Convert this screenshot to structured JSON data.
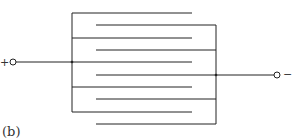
{
  "diagram": {
    "type": "interleaved-plate-capacitor",
    "caption": "(b)",
    "terminals": {
      "positive": {
        "label": "+",
        "x": 10,
        "y": 62
      },
      "negative": {
        "label": "−",
        "x": 278,
        "y": 75
      }
    },
    "left_bus_x": 72,
    "right_bus_x": 216,
    "left_plates": [
      {
        "y": 13,
        "x1": 72,
        "x2": 192
      },
      {
        "y": 38,
        "x1": 72,
        "x2": 192
      },
      {
        "y": 62,
        "x1": 72,
        "x2": 192
      },
      {
        "y": 87,
        "x1": 72,
        "x2": 192
      },
      {
        "y": 112,
        "x1": 72,
        "x2": 192
      }
    ],
    "right_plates": [
      {
        "y": 25,
        "x1": 96,
        "x2": 216
      },
      {
        "y": 50,
        "x1": 96,
        "x2": 216
      },
      {
        "y": 75,
        "x1": 96,
        "x2": 216
      },
      {
        "y": 99,
        "x1": 96,
        "x2": 216
      },
      {
        "y": 124,
        "x1": 96,
        "x2": 216
      }
    ],
    "line_color": "#222222"
  }
}
